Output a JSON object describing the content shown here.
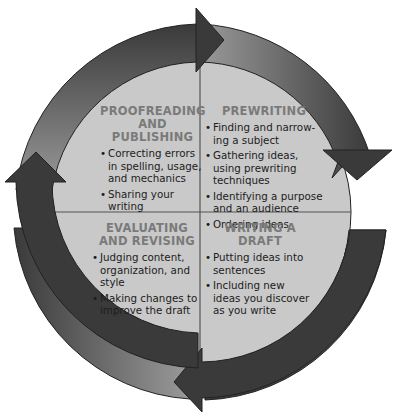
{
  "diagram": {
    "type": "cycle",
    "colors": {
      "arrow_dark": "#3a3a3a",
      "arrow_light": "#9a9a9a",
      "quadrant_fill": "#c9c9c9",
      "heading": "#7a7a7a",
      "text": "#1c1c1c"
    },
    "quadrants": [
      {
        "title": "PROOFREADING AND PUBLISHING",
        "items": [
          "Correcting errors in spelling, usage, and mechanics",
          "Sharing your writing"
        ]
      },
      {
        "title": "PREWRITING",
        "items": [
          "Finding and narrow-ing a subject",
          "Gathering ideas, using prewriting techniques",
          "Identifying a purpose and an audience",
          "Ordering ideas"
        ]
      },
      {
        "title": "EVALUATING AND REVISING",
        "items": [
          "Judging content, organization, and style",
          "Making changes to improve the draft"
        ]
      },
      {
        "title": "WRITING A DRAFT",
        "items": [
          "Putting ideas into sentences",
          "Including new ideas you discover as you write"
        ]
      }
    ]
  }
}
